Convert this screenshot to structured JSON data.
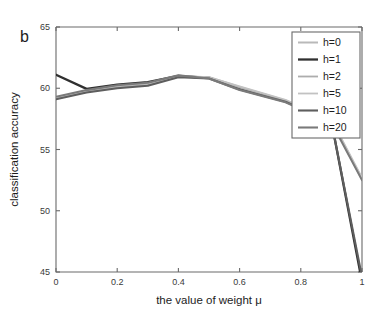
{
  "panel": {
    "label": "b"
  },
  "chart_data": {
    "type": "line",
    "title": "",
    "xlabel": "the value of weight μ",
    "ylabel": "classification accuracy",
    "xlim": [
      0,
      1
    ],
    "ylim": [
      45,
      65
    ],
    "xticks": [
      0,
      0.2,
      0.4,
      0.6,
      0.8,
      1
    ],
    "xticklabels": [
      "0",
      "0.2",
      "0.4",
      "0.6",
      "0.8",
      "1"
    ],
    "yticks": [
      45,
      50,
      55,
      60,
      65
    ],
    "yticklabels": [
      "45",
      "50",
      "55",
      "60",
      "65"
    ],
    "grid": false,
    "legend_position": "upper right",
    "x": [
      0,
      0.1,
      0.2,
      0.3,
      0.4,
      0.5,
      0.6,
      0.75,
      0.9,
      1
    ],
    "series": [
      {
        "name": "h=0",
        "label": "h=0",
        "color": "#b9b9b9",
        "width": 2.0,
        "values": [
          59.15,
          59.75,
          60.15,
          60.35,
          60.95,
          60.9,
          60.1,
          59.0,
          57.4,
          52.6
        ]
      },
      {
        "name": "h=1",
        "label": "h=1",
        "color": "#303030",
        "width": 2.3,
        "values": [
          61.1,
          59.95,
          60.3,
          60.5,
          61.0,
          60.85,
          60.0,
          58.95,
          57.3,
          44.2
        ]
      },
      {
        "name": "h=2",
        "label": "h=2",
        "color": "#adadad",
        "width": 1.8,
        "values": [
          59.2,
          59.7,
          60.1,
          60.3,
          60.95,
          60.85,
          60.05,
          58.95,
          57.35,
          52.55
        ]
      },
      {
        "name": "h=5",
        "label": "h=5",
        "color": "#c2c2c2",
        "width": 1.8,
        "values": [
          59.25,
          59.8,
          60.2,
          60.4,
          61.0,
          60.9,
          60.15,
          59.05,
          57.45,
          52.7
        ]
      },
      {
        "name": "h=10",
        "label": "h=10",
        "color": "#5e5e5e",
        "width": 2.1,
        "values": [
          59.1,
          59.65,
          60.0,
          60.2,
          60.9,
          60.8,
          59.9,
          58.9,
          57.25,
          44.6
        ]
      },
      {
        "name": "h=20",
        "label": "h=20",
        "color": "#7a7a7a",
        "width": 2.1,
        "values": [
          59.3,
          59.85,
          60.25,
          60.45,
          61.05,
          60.8,
          59.85,
          58.85,
          57.2,
          52.5
        ]
      }
    ]
  }
}
